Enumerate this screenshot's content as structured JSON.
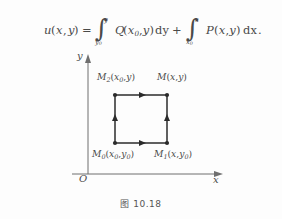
{
  "formula": {
    "full_text": "u(x,y) = ∫_{y0}^{y} Q(x0,y)dy + ∫_{x0}^{x} P(x,y)dx.",
    "lhs_fn": "u",
    "lhs_open": "(",
    "lhs_var1": "x",
    "lhs_comma": ",",
    "lhs_var2": "y",
    "lhs_close": ")",
    "equals": "=",
    "int1_sign": "∫",
    "int1_upper": "y",
    "int1_lower": "y0",
    "int1_fn": "Q",
    "int1_args": "(x0,y)",
    "int1_differential": "dy",
    "plus": "+",
    "int2_sign": "∫",
    "int2_upper": "x",
    "int2_lower": "x0",
    "int2_fn": "P",
    "int2_args": "(x,y)",
    "int2_differential": "dx",
    "period": "."
  },
  "diagram": {
    "y_axis_label": "y",
    "x_axis_label": "x",
    "origin_label": "O",
    "points": [
      {
        "id": "M2",
        "name": "M",
        "index": "2",
        "coords": "(x0,y)",
        "coord_x": "x",
        "coord_x_sub": "0",
        "coord_y": "y",
        "coord_y_sub": "",
        "position": "top-left"
      },
      {
        "id": "M",
        "name": "M",
        "index": "",
        "coords": "(x,y)",
        "coord_x": "x",
        "coord_x_sub": "",
        "coord_y": "y",
        "coord_y_sub": "",
        "position": "top-right"
      },
      {
        "id": "M0",
        "name": "M",
        "index": "0",
        "coords": "(x0,y0)",
        "coord_x": "x",
        "coord_x_sub": "0",
        "coord_y": "y",
        "coord_y_sub": "0",
        "position": "bottom-left"
      },
      {
        "id": "M1",
        "name": "M",
        "index": "1",
        "coords": "(x,y0)",
        "coord_x": "x",
        "coord_x_sub": "",
        "coord_y": "y",
        "coord_y_sub": "0",
        "position": "bottom-right"
      }
    ],
    "path_edges": [
      {
        "from": "M0",
        "to": "M1",
        "direction": "right",
        "arrow": true
      },
      {
        "from": "M1",
        "to": "M",
        "direction": "up",
        "arrow": true
      },
      {
        "from": "M0",
        "to": "M2",
        "direction": "up",
        "arrow": true
      },
      {
        "from": "M2",
        "to": "M",
        "direction": "right",
        "arrow": true
      }
    ],
    "stroke_color": "#2b2b2b",
    "axis_color": "#6f6f6f"
  },
  "caption": {
    "text": "图 10.18"
  }
}
